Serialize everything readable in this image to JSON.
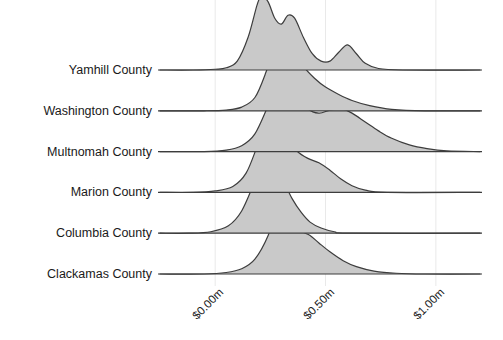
{
  "chart_data": {
    "type": "area",
    "title": "",
    "xlabel": "",
    "ylabel": "",
    "orientation": "ridgeline",
    "grid": true,
    "legend": null,
    "xlim": [
      -0.25,
      1.2
    ],
    "x_ticks": [
      {
        "value": 0.0,
        "label": "$0.00m"
      },
      {
        "value": 0.5,
        "label": "$0.50m"
      },
      {
        "value": 1.0,
        "label": "$1.00m"
      }
    ],
    "categories": [
      "Yamhill County",
      "Washington County",
      "Multnomah County",
      "Marion County",
      "Columbia County",
      "Clackamas County"
    ],
    "series": [
      {
        "name": "Yamhill County",
        "peak_x": 0.21,
        "peak_height": 1.0,
        "density": [
          {
            "x": -0.25,
            "y": 0.0
          },
          {
            "x": -0.1,
            "y": 0.0
          },
          {
            "x": 0.0,
            "y": 0.01
          },
          {
            "x": 0.05,
            "y": 0.03
          },
          {
            "x": 0.1,
            "y": 0.12
          },
          {
            "x": 0.15,
            "y": 0.45
          },
          {
            "x": 0.19,
            "y": 0.88
          },
          {
            "x": 0.21,
            "y": 1.0
          },
          {
            "x": 0.24,
            "y": 0.92
          },
          {
            "x": 0.27,
            "y": 0.7
          },
          {
            "x": 0.3,
            "y": 0.62
          },
          {
            "x": 0.33,
            "y": 0.74
          },
          {
            "x": 0.36,
            "y": 0.7
          },
          {
            "x": 0.4,
            "y": 0.44
          },
          {
            "x": 0.44,
            "y": 0.22
          },
          {
            "x": 0.48,
            "y": 0.12
          },
          {
            "x": 0.52,
            "y": 0.12
          },
          {
            "x": 0.56,
            "y": 0.24
          },
          {
            "x": 0.6,
            "y": 0.34
          },
          {
            "x": 0.64,
            "y": 0.22
          },
          {
            "x": 0.68,
            "y": 0.09
          },
          {
            "x": 0.74,
            "y": 0.02
          },
          {
            "x": 0.85,
            "y": 0.0
          },
          {
            "x": 1.2,
            "y": 0.0
          }
        ]
      },
      {
        "name": "Washington County",
        "peak_x": 0.29,
        "peak_height": 1.0,
        "density": [
          {
            "x": -0.25,
            "y": 0.0
          },
          {
            "x": -0.05,
            "y": 0.0
          },
          {
            "x": 0.05,
            "y": 0.01
          },
          {
            "x": 0.12,
            "y": 0.05
          },
          {
            "x": 0.18,
            "y": 0.18
          },
          {
            "x": 0.23,
            "y": 0.52
          },
          {
            "x": 0.27,
            "y": 0.9
          },
          {
            "x": 0.29,
            "y": 1.0
          },
          {
            "x": 0.32,
            "y": 0.97
          },
          {
            "x": 0.36,
            "y": 0.8
          },
          {
            "x": 0.4,
            "y": 0.6
          },
          {
            "x": 0.45,
            "y": 0.44
          },
          {
            "x": 0.5,
            "y": 0.32
          },
          {
            "x": 0.56,
            "y": 0.22
          },
          {
            "x": 0.62,
            "y": 0.14
          },
          {
            "x": 0.7,
            "y": 0.07
          },
          {
            "x": 0.8,
            "y": 0.02
          },
          {
            "x": 0.95,
            "y": 0.0
          },
          {
            "x": 1.2,
            "y": 0.0
          }
        ]
      },
      {
        "name": "Multnomah County",
        "peak_x": 0.31,
        "peak_height": 1.0,
        "density": [
          {
            "x": -0.25,
            "y": 0.0
          },
          {
            "x": -0.05,
            "y": 0.0
          },
          {
            "x": 0.05,
            "y": 0.02
          },
          {
            "x": 0.12,
            "y": 0.08
          },
          {
            "x": 0.18,
            "y": 0.24
          },
          {
            "x": 0.24,
            "y": 0.62
          },
          {
            "x": 0.29,
            "y": 0.95
          },
          {
            "x": 0.31,
            "y": 1.0
          },
          {
            "x": 0.34,
            "y": 0.96
          },
          {
            "x": 0.38,
            "y": 0.76
          },
          {
            "x": 0.42,
            "y": 0.58
          },
          {
            "x": 0.47,
            "y": 0.52
          },
          {
            "x": 0.52,
            "y": 0.56
          },
          {
            "x": 0.57,
            "y": 0.58
          },
          {
            "x": 0.62,
            "y": 0.52
          },
          {
            "x": 0.68,
            "y": 0.4
          },
          {
            "x": 0.74,
            "y": 0.28
          },
          {
            "x": 0.8,
            "y": 0.18
          },
          {
            "x": 0.88,
            "y": 0.09
          },
          {
            "x": 0.96,
            "y": 0.04
          },
          {
            "x": 1.05,
            "y": 0.01
          },
          {
            "x": 1.2,
            "y": 0.0
          }
        ]
      },
      {
        "name": "Marion County",
        "peak_x": 0.25,
        "peak_height": 1.0,
        "density": [
          {
            "x": -0.25,
            "y": 0.0
          },
          {
            "x": -0.1,
            "y": 0.0
          },
          {
            "x": 0.0,
            "y": 0.02
          },
          {
            "x": 0.08,
            "y": 0.08
          },
          {
            "x": 0.14,
            "y": 0.26
          },
          {
            "x": 0.19,
            "y": 0.62
          },
          {
            "x": 0.23,
            "y": 0.94
          },
          {
            "x": 0.25,
            "y": 1.0
          },
          {
            "x": 0.28,
            "y": 0.94
          },
          {
            "x": 0.32,
            "y": 0.74
          },
          {
            "x": 0.37,
            "y": 0.56
          },
          {
            "x": 0.42,
            "y": 0.46
          },
          {
            "x": 0.47,
            "y": 0.4
          },
          {
            "x": 0.52,
            "y": 0.3
          },
          {
            "x": 0.57,
            "y": 0.18
          },
          {
            "x": 0.62,
            "y": 0.09
          },
          {
            "x": 0.68,
            "y": 0.03
          },
          {
            "x": 0.78,
            "y": 0.0
          },
          {
            "x": 1.2,
            "y": 0.0
          }
        ]
      },
      {
        "name": "Columbia County",
        "peak_x": 0.24,
        "peak_height": 1.0,
        "density": [
          {
            "x": -0.25,
            "y": 0.0
          },
          {
            "x": -0.12,
            "y": 0.0
          },
          {
            "x": -0.02,
            "y": 0.02
          },
          {
            "x": 0.06,
            "y": 0.1
          },
          {
            "x": 0.12,
            "y": 0.3
          },
          {
            "x": 0.18,
            "y": 0.7
          },
          {
            "x": 0.22,
            "y": 0.96
          },
          {
            "x": 0.24,
            "y": 1.0
          },
          {
            "x": 0.27,
            "y": 0.92
          },
          {
            "x": 0.31,
            "y": 0.7
          },
          {
            "x": 0.35,
            "y": 0.46
          },
          {
            "x": 0.39,
            "y": 0.28
          },
          {
            "x": 0.43,
            "y": 0.15
          },
          {
            "x": 0.48,
            "y": 0.07
          },
          {
            "x": 0.54,
            "y": 0.02
          },
          {
            "x": 0.62,
            "y": 0.0
          },
          {
            "x": 1.2,
            "y": 0.0
          }
        ]
      },
      {
        "name": "Clackamas County",
        "peak_x": 0.3,
        "peak_height": 1.0,
        "density": [
          {
            "x": -0.25,
            "y": 0.0
          },
          {
            "x": -0.05,
            "y": 0.0
          },
          {
            "x": 0.05,
            "y": 0.02
          },
          {
            "x": 0.12,
            "y": 0.07
          },
          {
            "x": 0.18,
            "y": 0.2
          },
          {
            "x": 0.24,
            "y": 0.52
          },
          {
            "x": 0.28,
            "y": 0.9
          },
          {
            "x": 0.3,
            "y": 1.0
          },
          {
            "x": 0.33,
            "y": 0.92
          },
          {
            "x": 0.36,
            "y": 0.7
          },
          {
            "x": 0.39,
            "y": 0.58
          },
          {
            "x": 0.43,
            "y": 0.52
          },
          {
            "x": 0.47,
            "y": 0.42
          },
          {
            "x": 0.52,
            "y": 0.3
          },
          {
            "x": 0.58,
            "y": 0.18
          },
          {
            "x": 0.64,
            "y": 0.1
          },
          {
            "x": 0.72,
            "y": 0.04
          },
          {
            "x": 0.82,
            "y": 0.01
          },
          {
            "x": 0.95,
            "y": 0.0
          },
          {
            "x": 1.2,
            "y": 0.0
          }
        ]
      }
    ],
    "colors": {
      "fill": "#c9c9c9",
      "stroke": "#3d3d3d",
      "grid": "#e9e9e9",
      "text": "#1a1a1a",
      "background": "#ffffff"
    }
  }
}
